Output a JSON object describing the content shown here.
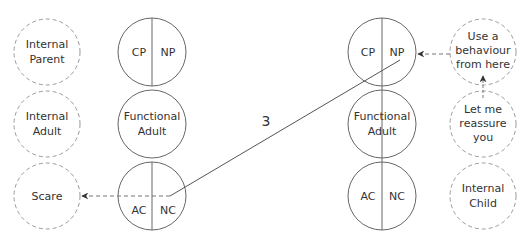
{
  "diagram": {
    "type": "transactional-analysis-ego-states",
    "top_caption_partial": "",
    "colors": {
      "stroke": "#666666",
      "dashed_stroke": "#999999",
      "text": "#333333",
      "background": "#ffffff"
    },
    "left_internal_column": [
      {
        "id": "internal-parent",
        "line1": "Internal",
        "line2": "Parent",
        "style": "dashed"
      },
      {
        "id": "internal-adult",
        "line1": "Internal",
        "line2": "Adult",
        "style": "dashed"
      },
      {
        "id": "scare",
        "line1": "Scare",
        "line2": "",
        "style": "dashed"
      }
    ],
    "left_ego": {
      "parent": {
        "left": "CP",
        "right": "NP"
      },
      "adult": {
        "line1": "Functional",
        "line2": "Adult"
      },
      "child": {
        "left": "AC",
        "right": "NC"
      }
    },
    "right_ego": {
      "parent": {
        "left": "CP",
        "right": "NP"
      },
      "adult": {
        "line1": "Functional",
        "line2": "Adult"
      },
      "child": {
        "left": "AC",
        "right": "NC"
      }
    },
    "right_internal_column": [
      {
        "id": "use-behaviour",
        "line1": "Use a",
        "line2": "behaviour",
        "line3": "from here",
        "style": "dashed"
      },
      {
        "id": "reassure",
        "line1": "Let me",
        "line2": "reassure",
        "line3": "you",
        "style": "dashed"
      },
      {
        "id": "internal-child",
        "line1": "Internal",
        "line2": "Child",
        "line3": "",
        "style": "dashed"
      }
    ],
    "transaction_label": "3",
    "connections": [
      {
        "from": "left_ego.child.NC",
        "to": "right_ego.parent.NP",
        "style": "solid",
        "label": "3"
      },
      {
        "from": "left_ego.child.NC",
        "to": "scare",
        "style": "dashed-arrow"
      },
      {
        "from": "use-behaviour",
        "to": "right_ego.parent.NP",
        "style": "dashed-arrow"
      },
      {
        "from": "reassure",
        "to": "use-behaviour",
        "style": "dashed-arrow"
      }
    ]
  }
}
